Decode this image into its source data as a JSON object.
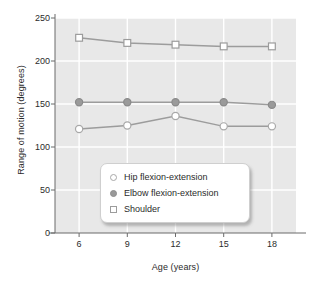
{
  "chart_data": {
    "type": "line",
    "title": "",
    "xlabel": "Age (years)",
    "ylabel": "Range of motion (degrees)",
    "x": [
      6,
      9,
      12,
      15,
      18
    ],
    "xticklabels": [
      "6",
      "9",
      "12",
      "15",
      "18"
    ],
    "yticklabels": [
      "0",
      "50",
      "100",
      "150",
      "200",
      "250"
    ],
    "yticks": [
      0,
      50,
      100,
      150,
      200,
      250
    ],
    "xlim": [
      4.5,
      19.5
    ],
    "ylim": [
      0,
      250
    ],
    "grid": true,
    "legend_position": "lower-center",
    "series": [
      {
        "name": "Hip flexion-extension",
        "marker": "open-circle",
        "values": [
          121,
          125,
          136,
          124,
          124
        ]
      },
      {
        "name": "Elbow flexion-extension",
        "marker": "filled-circle",
        "values": [
          152,
          152,
          152,
          152,
          149
        ]
      },
      {
        "name": "Shoulder",
        "marker": "open-square",
        "values": [
          227,
          221,
          219,
          217,
          217
        ]
      }
    ],
    "colors": {
      "plot_background": "#e8e8e8",
      "gridline": "#ffffff",
      "axis": "#6b6b6b",
      "line": "#9c9c9c",
      "text": "#2b2b2b"
    }
  },
  "legend": {
    "items": [
      {
        "label": "Hip flexion-extension"
      },
      {
        "label": "Elbow flexion-extension"
      },
      {
        "label": "Shoulder"
      }
    ]
  }
}
